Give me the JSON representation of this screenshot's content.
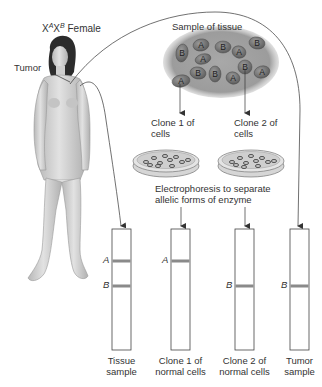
{
  "title": {
    "genotype_prefix": "X",
    "allele_1": "A",
    "mid": "X",
    "allele_2": "B",
    "suffix": " Female"
  },
  "labels": {
    "tumor": "Tumor",
    "sample_of_tissue": "Sample of tissue",
    "clone1_line1": "Clone 1 of",
    "clone1_line2": "cells",
    "clone2_line1": "Clone 2 of",
    "clone2_line2": "cells",
    "electro_line1": "Electrophoresis to separate",
    "electro_line2": "allelic forms of enzyme"
  },
  "tissue_cells": [
    {
      "allele": "B",
      "x": 182,
      "y": 53,
      "rx": 6,
      "ry": 9,
      "rot": 10
    },
    {
      "allele": "A",
      "x": 201,
      "y": 45,
      "rx": 8,
      "ry": 6,
      "rot": -10
    },
    {
      "allele": "B",
      "x": 223,
      "y": 47,
      "rx": 8,
      "ry": 6,
      "rot": 0
    },
    {
      "allele": "A",
      "x": 239,
      "y": 52,
      "rx": 7,
      "ry": 6,
      "rot": 20
    },
    {
      "allele": "B",
      "x": 257,
      "y": 43,
      "rx": 8,
      "ry": 6,
      "rot": 10
    },
    {
      "allele": "A",
      "x": 203,
      "y": 59,
      "rx": 8,
      "ry": 5,
      "rot": -15
    },
    {
      "allele": "B",
      "x": 198,
      "y": 73,
      "rx": 8,
      "ry": 6,
      "rot": 10
    },
    {
      "allele": "B",
      "x": 215,
      "y": 74,
      "rx": 6,
      "ry": 8,
      "rot": 0
    },
    {
      "allele": "A",
      "x": 233,
      "y": 78,
      "rx": 7,
      "ry": 6,
      "rot": 20
    },
    {
      "allele": "B",
      "x": 245,
      "y": 67,
      "rx": 7,
      "ry": 7,
      "rot": 0
    },
    {
      "allele": "A",
      "x": 262,
      "y": 72,
      "rx": 8,
      "ry": 6,
      "rot": -15
    },
    {
      "allele": "A",
      "x": 181,
      "y": 81,
      "rx": 9,
      "ry": 6,
      "rot": -10
    }
  ],
  "lanes": [
    {
      "id": "tissue",
      "x": 112,
      "label_line1": "Tissue",
      "label_line2": "sample",
      "bands": [
        "A",
        "B"
      ]
    },
    {
      "id": "clone1",
      "x": 171,
      "label_line1": "Clone 1 of",
      "label_line2": "normal cells",
      "bands": [
        "A"
      ]
    },
    {
      "id": "clone2",
      "x": 235,
      "label_line1": "Clone 2 of",
      "label_line2": "normal cells",
      "bands": [
        "B"
      ]
    },
    {
      "id": "tumor",
      "x": 290,
      "label_line1": "Tumor",
      "label_line2": "sample",
      "bands": [
        "B"
      ]
    }
  ],
  "band_letters": {
    "A": "A",
    "B": "B"
  },
  "colors": {
    "line": "#333333",
    "band": "#8a8a8a",
    "cell_fill": "#6e6e6e",
    "tissue_bg": "#9a9a9a",
    "dish": "#c8c8c8",
    "skin": "#d4d4d4"
  }
}
